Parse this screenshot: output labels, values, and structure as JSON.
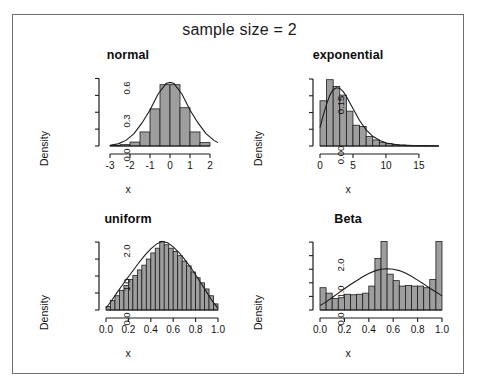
{
  "figure": {
    "main_title": "sample size = 2",
    "background": "#ffffff",
    "border_color": "#6e6e6e",
    "bar_fill": "#9e9e9e",
    "bar_stroke": "#1c1c1c",
    "curve_color": "#1c1c1c"
  },
  "panels": [
    {
      "id": "normal",
      "title": "normal",
      "xlabel": "x",
      "ylabel": "Density"
    },
    {
      "id": "exponential",
      "title": "exponential",
      "xlabel": "x",
      "ylabel": "Density"
    },
    {
      "id": "uniform",
      "title": "uniform",
      "xlabel": "x",
      "ylabel": "Density"
    },
    {
      "id": "beta",
      "title": "Beta",
      "xlabel": "x",
      "ylabel": "Density"
    }
  ],
  "chart_data": [
    {
      "type": "bar",
      "id": "normal",
      "title": "normal",
      "xlabel": "x",
      "ylabel": "Density",
      "grid": false,
      "legend": "none",
      "xlim": [
        -3.2,
        2.4
      ],
      "ylim": [
        0,
        0.64
      ],
      "xticks": [
        -3,
        -2,
        -1,
        0,
        1,
        2
      ],
      "xtick_labels": [
        "-3",
        "-2",
        "-1",
        "0",
        "1",
        "2"
      ],
      "yticks": [
        0.0,
        0.3,
        0.6
      ],
      "ytick_labels": [
        "0.0",
        "0.3",
        "0.6"
      ],
      "yminor_ticks": [
        0.15,
        0.45
      ],
      "bin_edges": [
        -3.0,
        -2.5,
        -2.0,
        -1.5,
        -1.0,
        -0.5,
        0.0,
        0.5,
        1.0,
        1.5,
        2.0
      ],
      "values": [
        0.004,
        0.012,
        0.035,
        0.125,
        0.33,
        0.545,
        0.545,
        0.34,
        0.125,
        0.03
      ],
      "curve": {
        "name": "normal density",
        "x": [
          -3.0,
          -2.6,
          -2.2,
          -1.8,
          -1.4,
          -1.0,
          -0.6,
          -0.2,
          0.0,
          0.2,
          0.6,
          1.0,
          1.4,
          1.8,
          2.2,
          2.4
        ],
        "y": [
          0.006,
          0.019,
          0.05,
          0.11,
          0.205,
          0.32,
          0.46,
          0.555,
          0.565,
          0.555,
          0.46,
          0.32,
          0.205,
          0.11,
          0.05,
          0.03
        ]
      }
    },
    {
      "type": "bar",
      "id": "exponential",
      "title": "exponential",
      "xlabel": "x",
      "ylabel": "Density",
      "grid": false,
      "legend": "none",
      "xlim": [
        0,
        18.5
      ],
      "ylim": [
        0,
        0.215
      ],
      "xticks": [
        0,
        5,
        10,
        15
      ],
      "xtick_labels": [
        "0",
        "5",
        "10",
        "15"
      ],
      "yticks": [
        0.0,
        0.15
      ],
      "ytick_labels": [
        "0.00",
        "0.15"
      ],
      "yminor_ticks": [
        0.05,
        0.1,
        0.2
      ],
      "bin_edges": [
        0,
        1,
        2,
        3,
        4,
        5,
        6,
        7,
        8,
        9,
        10,
        11,
        12,
        13,
        14,
        15,
        16,
        17,
        18
      ],
      "values": [
        0.135,
        0.198,
        0.178,
        0.152,
        0.104,
        0.062,
        0.058,
        0.028,
        0.018,
        0.011,
        0.007,
        0.004,
        0.003,
        0.002,
        0.001,
        0.001,
        0.0005,
        0.0003
      ],
      "curve": {
        "name": "gamma density",
        "x": [
          0,
          0.5,
          1.0,
          1.5,
          2.0,
          2.5,
          3.0,
          3.5,
          4.0,
          5.0,
          6.0,
          7.0,
          8.0,
          9.0,
          10.0,
          12.0,
          14.0,
          16.0,
          18.0
        ],
        "y": [
          0.055,
          0.092,
          0.125,
          0.152,
          0.168,
          0.174,
          0.172,
          0.163,
          0.148,
          0.112,
          0.076,
          0.048,
          0.029,
          0.017,
          0.009,
          0.003,
          0.001,
          0.0004,
          0.0001
        ]
      }
    },
    {
      "type": "bar",
      "id": "uniform",
      "title": "uniform",
      "xlabel": "x",
      "ylabel": "Density",
      "grid": false,
      "legend": "none",
      "xlim": [
        0,
        1
      ],
      "ylim": [
        0,
        2.12
      ],
      "xticks": [
        0.0,
        0.2,
        0.4,
        0.6,
        0.8,
        1.0
      ],
      "xtick_labels": [
        "0.0",
        "0.2",
        "0.4",
        "0.6",
        "0.8",
        "1.0"
      ],
      "yticks": [
        0.0,
        1.0,
        2.0
      ],
      "ytick_labels": [
        "0.0",
        "1.0",
        "2.0"
      ],
      "yminor_ticks": [
        0.5,
        1.5
      ],
      "bin_edges": [
        0.0,
        0.04,
        0.08,
        0.12,
        0.16,
        0.2,
        0.24,
        0.28,
        0.32,
        0.36,
        0.4,
        0.44,
        0.48,
        0.52,
        0.56,
        0.6,
        0.64,
        0.68,
        0.72,
        0.76,
        0.8,
        0.84,
        0.88,
        0.92,
        0.96,
        1.0
      ],
      "values": [
        0.1,
        0.28,
        0.42,
        0.58,
        0.72,
        0.9,
        1.02,
        1.18,
        1.32,
        1.5,
        1.68,
        1.82,
        2.02,
        1.92,
        1.82,
        1.72,
        1.6,
        1.44,
        1.3,
        1.12,
        0.95,
        0.8,
        0.62,
        0.42,
        0.18
      ],
      "curve": {
        "name": "triangular density",
        "x": [
          0.0,
          0.05,
          0.1,
          0.15,
          0.2,
          0.25,
          0.3,
          0.35,
          0.4,
          0.45,
          0.5,
          0.55,
          0.6,
          0.65,
          0.7,
          0.75,
          0.8,
          0.85,
          0.9,
          0.95,
          1.0
        ],
        "y": [
          0.05,
          0.28,
          0.52,
          0.75,
          0.98,
          1.2,
          1.42,
          1.62,
          1.8,
          1.94,
          2.02,
          1.98,
          1.86,
          1.7,
          1.5,
          1.28,
          1.04,
          0.78,
          0.52,
          0.26,
          0.05
        ]
      }
    },
    {
      "type": "bar",
      "id": "beta",
      "title": "Beta",
      "xlabel": "x",
      "ylabel": "Density",
      "grid": false,
      "legend": "none",
      "xlim": [
        0,
        1
      ],
      "ylim": [
        0,
        2.65
      ],
      "xticks": [
        0.0,
        0.2,
        0.4,
        0.6,
        0.8,
        1.0
      ],
      "xtick_labels": [
        "0.0",
        "0.2",
        "0.4",
        "0.6",
        "0.8",
        "1.0"
      ],
      "yticks": [
        0.0,
        1.0,
        2.0
      ],
      "ytick_labels": [
        "0.0",
        "1.0",
        "2.0"
      ],
      "yminor_ticks": [
        0.5,
        1.5,
        2.5
      ],
      "bin_edges": [
        0.0,
        0.05,
        0.1,
        0.15,
        0.2,
        0.25,
        0.3,
        0.35,
        0.4,
        0.45,
        0.5,
        0.55,
        0.6,
        0.65,
        0.7,
        0.75,
        0.8,
        0.85,
        0.9,
        0.95,
        1.0
      ],
      "values": [
        0.82,
        0.62,
        0.42,
        0.45,
        0.58,
        0.56,
        0.58,
        0.62,
        0.88,
        1.9,
        2.52,
        1.32,
        1.08,
        0.88,
        0.9,
        0.88,
        0.88,
        0.82,
        1.12,
        2.52
      ],
      "curve": {
        "name": "beta density",
        "x": [
          0.0,
          0.05,
          0.1,
          0.15,
          0.2,
          0.25,
          0.3,
          0.35,
          0.4,
          0.45,
          0.5,
          0.55,
          0.6,
          0.65,
          0.7,
          0.75,
          0.8,
          0.85,
          0.9,
          0.95,
          1.0
        ],
        "y": [
          0.16,
          0.3,
          0.46,
          0.62,
          0.78,
          0.94,
          1.08,
          1.22,
          1.34,
          1.44,
          1.5,
          1.52,
          1.5,
          1.45,
          1.36,
          1.24,
          1.1,
          0.96,
          0.8,
          0.66,
          0.52
        ]
      }
    }
  ]
}
